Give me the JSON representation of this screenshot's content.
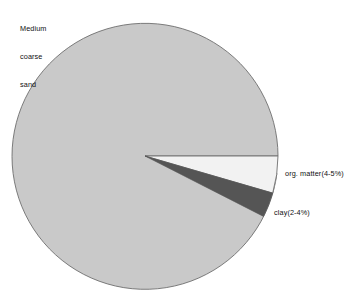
{
  "chart_data": {
    "type": "pie",
    "title": "",
    "subtitle": "",
    "xlabel": "",
    "ylabel": "",
    "grid": false,
    "legend_position": "inline-labels",
    "center": {
      "x": 145,
      "y": 156
    },
    "radius": 133,
    "start_angle_deg": 0,
    "direction": "clockwise",
    "categories": [
      "Medium coarse sand",
      "org. matter(4-5%)",
      "clay(2-4%)"
    ],
    "values": [
      92.5,
      4.5,
      3.0
    ],
    "slices": [
      {
        "label": "Medium coarse sand",
        "label_lines": [
          "Medium",
          "coarse",
          "sand"
        ],
        "value": 92.5,
        "percent_range": "",
        "color": "#c9c9c9",
        "start_angle_deg": 7.5,
        "end_angle_deg": 360.0
      },
      {
        "label": "org. matter(4-5%)",
        "label_lines": [
          "org. matter(4-5%)"
        ],
        "value": 4.5,
        "percent_range": "4-5%",
        "color": "#f2f2f2",
        "start_angle_deg": 0.0,
        "end_angle_deg": 16.2
      },
      {
        "label": "clay(2-4%)",
        "label_lines": [
          "clay(2-4%)"
        ],
        "value": 3.0,
        "percent_range": "2-4%",
        "color": "#555555",
        "start_angle_deg": 16.2,
        "end_angle_deg": 27.0
      }
    ],
    "outline_color": "#6e6e6e",
    "background": "#ffffff"
  },
  "labels": {
    "sand": {
      "line1": "Medium",
      "line2": "coarse",
      "line3": "sand"
    },
    "org_matter": "org. matter(4-5%)",
    "clay": "clay(2-4%)"
  }
}
